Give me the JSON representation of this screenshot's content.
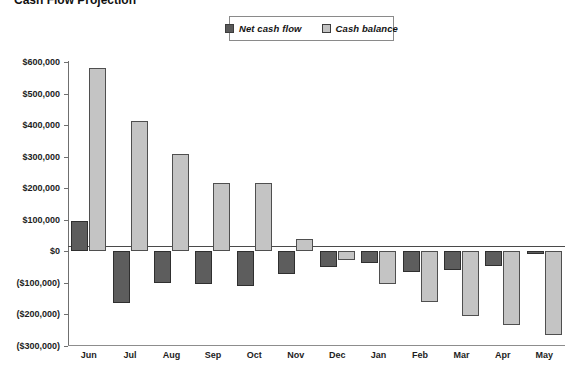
{
  "title": {
    "text": "Cash Flow Projection",
    "clipped": true
  },
  "legend": {
    "position": "top-center",
    "items": [
      {
        "label": "Net cash flow",
        "color": "#595959",
        "icon": "legend-swatch"
      },
      {
        "label": "Cash balance",
        "color": "#c2c2c2",
        "icon": "legend-swatch"
      }
    ]
  },
  "chart_data": {
    "type": "bar",
    "title": "Cash Flow Projection",
    "xlabel": "",
    "ylabel": "",
    "ylim": [
      -300000,
      600000
    ],
    "ytick_step": 100000,
    "grid": false,
    "legend_position": "top-center",
    "categories": [
      "Jun",
      "Jul",
      "Aug",
      "Sep",
      "Oct",
      "Nov",
      "Dec",
      "Jan",
      "Feb",
      "Mar",
      "Apr",
      "May"
    ],
    "ytick_labels": [
      "$600,000",
      "$500,000",
      "$400,000",
      "$300,000",
      "$200,000",
      "$100,000",
      "$0",
      "($100,000)",
      "($200,000)",
      "($300,000)"
    ],
    "ytick_values": [
      600000,
      500000,
      400000,
      300000,
      200000,
      100000,
      0,
      -100000,
      -200000,
      -300000
    ],
    "series": [
      {
        "name": "Net cash flow",
        "color": "#595959",
        "values": [
          95000,
          -165000,
          -100000,
          -105000,
          -110000,
          -72000,
          -50000,
          -38000,
          -65000,
          -58000,
          -48000,
          -8000
        ]
      },
      {
        "name": "Cash balance",
        "color": "#c2c2c2",
        "values": [
          580000,
          412000,
          308000,
          215000,
          215000,
          38000,
          -28000,
          -105000,
          -160000,
          -205000,
          -232000,
          -265000
        ]
      }
    ]
  }
}
